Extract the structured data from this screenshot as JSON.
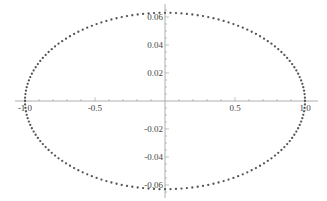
{
  "chart_data": {
    "type": "scatter",
    "title": "",
    "xlabel": "",
    "ylabel": "",
    "xlim": [
      -1.0,
      1.0
    ],
    "ylim": [
      -0.063,
      0.063
    ],
    "grid": false,
    "legend": null,
    "x_ticks": [
      {
        "value": -1.0,
        "label": "-1.0"
      },
      {
        "value": -0.5,
        "label": "-0.5"
      },
      {
        "value": 0.5,
        "label": "0.5"
      },
      {
        "value": 1.0,
        "label": "1.0"
      }
    ],
    "y_ticks": [
      {
        "value": 0.06,
        "label": "0.06"
      },
      {
        "value": 0.04,
        "label": "0.04"
      },
      {
        "value": 0.02,
        "label": "0.02"
      },
      {
        "value": -0.02,
        "label": "-0.02"
      },
      {
        "value": -0.04,
        "label": "-0.04"
      },
      {
        "value": -0.06,
        "label": "-0.06"
      }
    ],
    "series": [
      {
        "name": "ellipse",
        "shape": "ellipse",
        "center": [
          0,
          0
        ],
        "semi_axis_x": 1.0,
        "semi_axis_y": 0.063,
        "point_count": 160,
        "color": "#555555"
      }
    ]
  },
  "layout": {
    "origin_px": [
      165,
      101
    ],
    "x_px_per_unit": 140,
    "y_px_per_unit": 1400
  }
}
